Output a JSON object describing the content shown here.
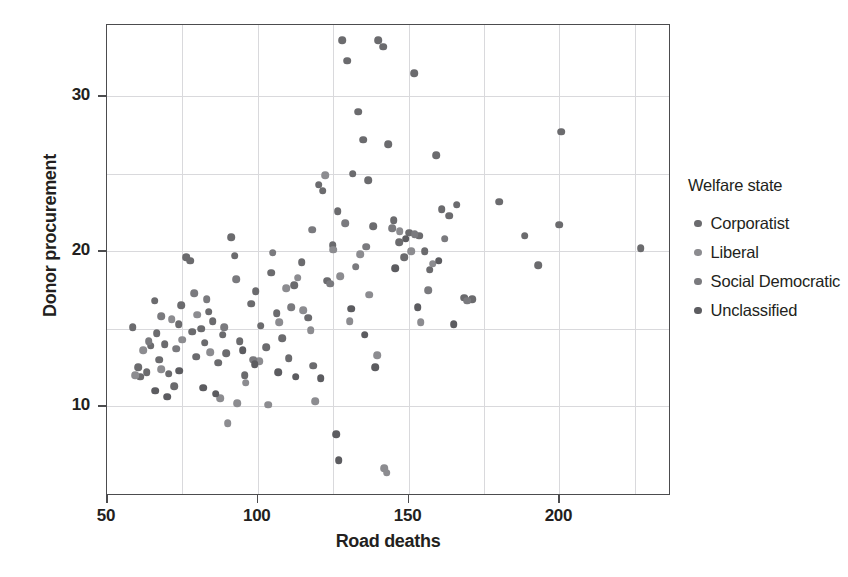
{
  "chart_data": {
    "type": "scatter",
    "title": "",
    "xlabel": "Road deaths",
    "ylabel": "Donor procurement",
    "xlim": [
      50,
      237
    ],
    "ylim": [
      4.2,
      34.6
    ],
    "xticks": [
      50,
      100,
      150,
      200
    ],
    "yticks": [
      10,
      20,
      30
    ],
    "x_gridlines": [
      75,
      100,
      125,
      150,
      175,
      200,
      225
    ],
    "y_gridlines": [
      10,
      15,
      20,
      25,
      30
    ],
    "grid": true,
    "legend": {
      "title": "Welfare state",
      "position": "right",
      "entries": [
        {
          "label": "Corporatist",
          "color": "#6b6b6e"
        },
        {
          "label": "Liberal",
          "color": "#8c8c90"
        },
        {
          "label": "Social Democratic",
          "color": "#7a7a7e"
        },
        {
          "label": "Unclassified",
          "color": "#5c5c60"
        }
      ]
    },
    "series": [
      {
        "name": "Corporatist",
        "color": "#6b6b6e",
        "points": [
          [
            58.5,
            15.1
          ],
          [
            60.4,
            12.5
          ],
          [
            61.0,
            11.9
          ],
          [
            63.2,
            12.2
          ],
          [
            64.5,
            13.9
          ],
          [
            65.8,
            16.8
          ],
          [
            66.5,
            14.7
          ],
          [
            67.3,
            13.0
          ],
          [
            69.1,
            14.0
          ],
          [
            70.5,
            12.1
          ],
          [
            72.2,
            11.3
          ],
          [
            73.8,
            15.3
          ],
          [
            74.6,
            16.5
          ],
          [
            76.2,
            19.6
          ],
          [
            77.5,
            19.4
          ],
          [
            78.3,
            14.8
          ],
          [
            79.6,
            13.2
          ],
          [
            81.2,
            15.0
          ],
          [
            82.4,
            14.1
          ],
          [
            83.7,
            16.1
          ],
          [
            85.0,
            15.5
          ],
          [
            86.8,
            12.8
          ],
          [
            88.3,
            14.6
          ],
          [
            89.5,
            13.4
          ],
          [
            91.2,
            20.9
          ],
          [
            92.4,
            19.7
          ],
          [
            94.0,
            14.2
          ],
          [
            95.6,
            12.0
          ],
          [
            97.8,
            16.6
          ],
          [
            99.3,
            17.4
          ],
          [
            101.0,
            15.2
          ],
          [
            102.7,
            13.8
          ],
          [
            104.5,
            18.6
          ],
          [
            106.2,
            16.0
          ],
          [
            108.0,
            14.4
          ],
          [
            110.3,
            13.1
          ],
          [
            112.0,
            17.8
          ],
          [
            114.5,
            19.3
          ],
          [
            116.8,
            15.7
          ],
          [
            118.4,
            12.6
          ],
          [
            120.2,
            24.3
          ],
          [
            121.5,
            23.9
          ],
          [
            123.0,
            18.1
          ],
          [
            124.8,
            20.4
          ],
          [
            126.5,
            22.6
          ],
          [
            128.0,
            33.6
          ],
          [
            129.7,
            32.3
          ],
          [
            131.4,
            25.0
          ],
          [
            133.2,
            29.0
          ],
          [
            135.0,
            27.2
          ],
          [
            136.6,
            24.6
          ],
          [
            138.3,
            21.6
          ],
          [
            140.0,
            33.6
          ],
          [
            141.5,
            33.2
          ],
          [
            143.2,
            26.9
          ],
          [
            145.0,
            22.0
          ],
          [
            146.8,
            20.6
          ],
          [
            148.5,
            19.6
          ],
          [
            150.2,
            21.2
          ],
          [
            151.8,
            31.5
          ],
          [
            153.5,
            21.0
          ],
          [
            155.3,
            20.0
          ],
          [
            157.0,
            18.8
          ],
          [
            159.2,
            26.2
          ],
          [
            161.0,
            22.7
          ],
          [
            163.5,
            22.3
          ],
          [
            166.0,
            23.0
          ],
          [
            168.5,
            17.0
          ],
          [
            171.0,
            16.9
          ],
          [
            180.0,
            23.2
          ],
          [
            188.5,
            21.0
          ],
          [
            193.0,
            19.1
          ],
          [
            200.5,
            27.7
          ],
          [
            200.0,
            21.7
          ],
          [
            227.0,
            20.2
          ]
        ]
      },
      {
        "name": "Liberal",
        "color": "#8c8c90",
        "points": [
          [
            59.3,
            12.0
          ],
          [
            62.1,
            13.6
          ],
          [
            68.0,
            12.4
          ],
          [
            71.4,
            15.6
          ],
          [
            75.0,
            14.3
          ],
          [
            80.0,
            15.9
          ],
          [
            84.2,
            13.5
          ],
          [
            87.5,
            10.5
          ],
          [
            90.0,
            8.9
          ],
          [
            93.1,
            10.2
          ],
          [
            96.0,
            11.5
          ],
          [
            100.5,
            12.9
          ],
          [
            103.4,
            10.1
          ],
          [
            107.1,
            15.4
          ],
          [
            109.5,
            17.6
          ],
          [
            113.2,
            18.3
          ],
          [
            115.0,
            16.2
          ],
          [
            117.6,
            14.9
          ],
          [
            119.0,
            10.3
          ],
          [
            122.3,
            24.9
          ],
          [
            125.0,
            20.1
          ],
          [
            127.4,
            18.4
          ],
          [
            130.5,
            15.5
          ],
          [
            134.0,
            19.8
          ],
          [
            137.0,
            17.2
          ],
          [
            139.5,
            13.3
          ],
          [
            142.0,
            6.0
          ],
          [
            142.8,
            5.7
          ],
          [
            147.0,
            21.3
          ],
          [
            150.8,
            20.0
          ],
          [
            154.0,
            15.4
          ],
          [
            158.0,
            19.2
          ]
        ]
      },
      {
        "name": "Social Democratic",
        "color": "#7a7a7e",
        "points": [
          [
            63.8,
            14.2
          ],
          [
            67.9,
            15.8
          ],
          [
            72.9,
            13.7
          ],
          [
            78.9,
            17.3
          ],
          [
            83.0,
            16.9
          ],
          [
            88.9,
            15.1
          ],
          [
            92.9,
            18.2
          ],
          [
            98.5,
            13.0
          ],
          [
            105.0,
            19.9
          ],
          [
            111.0,
            16.4
          ],
          [
            118.0,
            21.4
          ],
          [
            124.0,
            17.9
          ],
          [
            129.0,
            21.8
          ],
          [
            132.5,
            19.0
          ],
          [
            136.0,
            20.3
          ],
          [
            144.5,
            21.5
          ],
          [
            152.0,
            21.1
          ],
          [
            156.5,
            17.5
          ],
          [
            162.0,
            20.8
          ],
          [
            169.5,
            16.8
          ]
        ]
      },
      {
        "name": "Unclassified",
        "color": "#5c5c60",
        "points": [
          [
            66.0,
            11.0
          ],
          [
            70.0,
            10.6
          ],
          [
            74.0,
            12.3
          ],
          [
            81.8,
            11.2
          ],
          [
            86.0,
            10.8
          ],
          [
            95.0,
            13.6
          ],
          [
            99.0,
            12.7
          ],
          [
            106.8,
            12.2
          ],
          [
            112.5,
            11.9
          ],
          [
            120.8,
            11.8
          ],
          [
            126.0,
            8.2
          ],
          [
            126.8,
            6.5
          ],
          [
            131.0,
            16.3
          ],
          [
            135.5,
            14.6
          ],
          [
            139.0,
            12.5
          ],
          [
            145.5,
            18.9
          ],
          [
            149.0,
            20.8
          ],
          [
            153.0,
            16.4
          ],
          [
            160.0,
            19.4
          ],
          [
            165.0,
            15.3
          ]
        ]
      }
    ]
  }
}
